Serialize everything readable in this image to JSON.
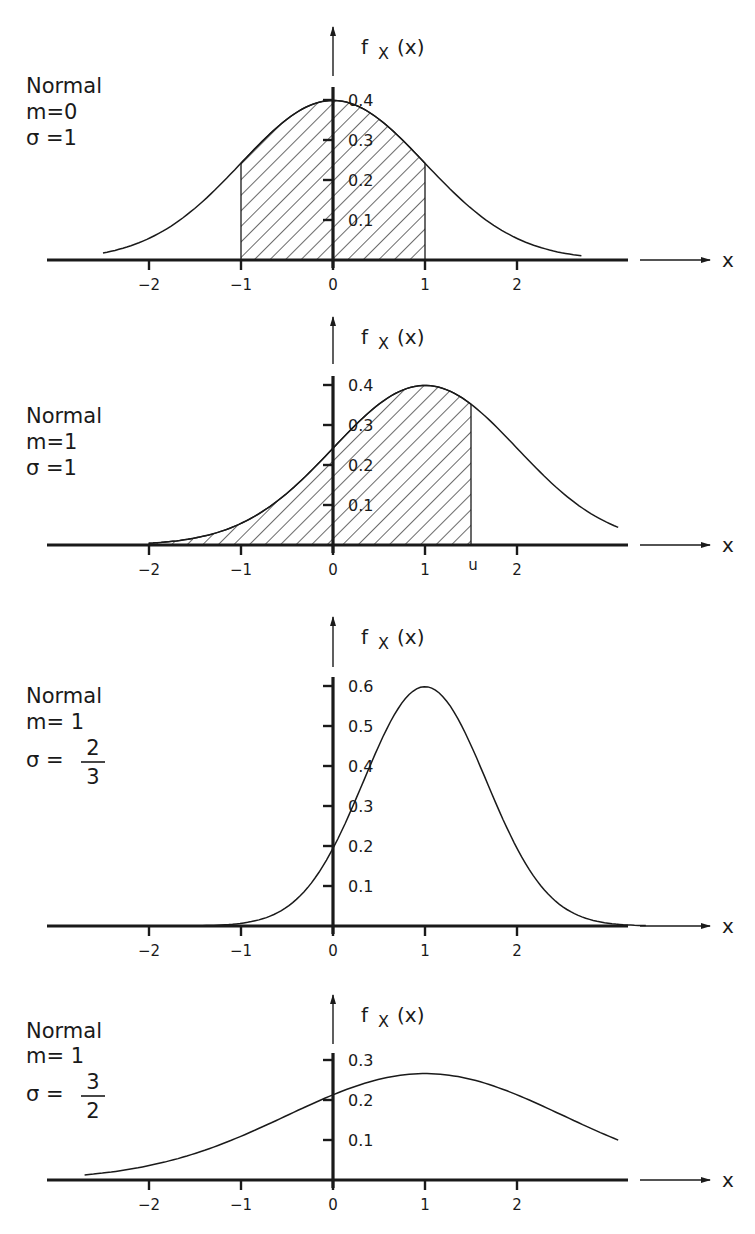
{
  "figure": {
    "axis_title_y": "f",
    "axis_title_y_sub": "X",
    "axis_title_y_arg": "(x)",
    "axis_title_x": "x",
    "colors": {
      "ink": "#1a1a1a",
      "background": "#ffffff"
    }
  },
  "panels": [
    {
      "name": "Normal",
      "m_label": "m=0",
      "sigma_label": "σ =1",
      "sigma_num": "",
      "sigma_den": "",
      "y_ticks": [
        "0.1",
        "0.2",
        "0.3",
        "0.4"
      ],
      "x_ticks": [
        "−2",
        "−1",
        "0",
        "1",
        "2"
      ],
      "shade_label": ""
    },
    {
      "name": "Normal",
      "m_label": "m=1",
      "sigma_label": "σ =1",
      "sigma_num": "",
      "sigma_den": "",
      "y_ticks": [
        "0.1",
        "0.2",
        "0.3",
        "0.4"
      ],
      "x_ticks": [
        "−2",
        "−1",
        "0",
        "1",
        "2"
      ],
      "shade_label": "u"
    },
    {
      "name": "Normal",
      "m_label": "m= 1",
      "sigma_label": "σ =",
      "sigma_num": "2",
      "sigma_den": "3",
      "y_ticks": [
        "0.1",
        "0.2",
        "0.3",
        "0.4",
        "0.5",
        "0.6"
      ],
      "x_ticks": [
        "−2",
        "−1",
        "0",
        "1",
        "2"
      ],
      "shade_label": ""
    },
    {
      "name": "Normal",
      "m_label": "m= 1",
      "sigma_label": "σ =",
      "sigma_num": "3",
      "sigma_den": "2",
      "y_ticks": [
        "0.1",
        "0.2",
        "0.3"
      ],
      "x_ticks": [
        "−2",
        "−1",
        "0",
        "1",
        "2"
      ],
      "shade_label": ""
    }
  ],
  "chart_data": [
    {
      "type": "line",
      "title": "Normal m=0 σ=1",
      "xlabel": "x",
      "ylabel": "f_X(x)",
      "mean": 0,
      "sigma": 1,
      "curve_x_range": [
        -2.5,
        2.7
      ],
      "shaded_interval": [
        -1,
        1
      ],
      "x_ticks": [
        -2,
        -1,
        0,
        1,
        2
      ],
      "y_ticks": [
        0.1,
        0.2,
        0.3,
        0.4
      ],
      "ylim": [
        0,
        0.43
      ],
      "x": [
        -2.5,
        -2,
        -1.5,
        -1,
        -0.5,
        0,
        0.5,
        1,
        1.5,
        2,
        2.5
      ],
      "values": [
        0.018,
        0.054,
        0.13,
        0.242,
        0.352,
        0.399,
        0.352,
        0.242,
        0.13,
        0.054,
        0.018
      ],
      "grid": false
    },
    {
      "type": "line",
      "title": "Normal m=1 σ=1",
      "xlabel": "x",
      "ylabel": "f_X(x)",
      "mean": 1,
      "sigma": 1,
      "curve_x_range": [
        -2,
        3.1
      ],
      "shaded_interval": [
        -2,
        1.5
      ],
      "shade_label": "u",
      "x_ticks": [
        -2,
        -1,
        0,
        1,
        2
      ],
      "y_ticks": [
        0.1,
        0.2,
        0.3,
        0.4
      ],
      "ylim": [
        0,
        0.43
      ],
      "x": [
        -2,
        -1.5,
        -1,
        -0.5,
        0,
        0.5,
        1,
        1.5,
        2,
        2.5,
        3
      ],
      "values": [
        0.004,
        0.018,
        0.054,
        0.13,
        0.242,
        0.352,
        0.399,
        0.352,
        0.242,
        0.13,
        0.054
      ],
      "grid": false
    },
    {
      "type": "line",
      "title": "Normal m=1 σ=2/3",
      "xlabel": "x",
      "ylabel": "f_X(x)",
      "mean": 1,
      "sigma": 0.6667,
      "curve_x_range": [
        -1.5,
        3.4
      ],
      "shaded_interval": null,
      "x_ticks": [
        -2,
        -1,
        0,
        1,
        2
      ],
      "y_ticks": [
        0.1,
        0.2,
        0.3,
        0.4,
        0.5,
        0.6
      ],
      "ylim": [
        0,
        0.63
      ],
      "x": [
        -1.5,
        -1,
        -0.5,
        0,
        0.5,
        1,
        1.5,
        2,
        2.5,
        3
      ],
      "values": [
        0.0005,
        0.007,
        0.048,
        0.194,
        0.451,
        0.598,
        0.451,
        0.194,
        0.048,
        0.007
      ],
      "grid": false
    },
    {
      "type": "line",
      "title": "Normal m=1 σ=3/2",
      "xlabel": "x",
      "ylabel": "f_X(x)",
      "mean": 1,
      "sigma": 1.5,
      "curve_x_range": [
        -2.7,
        3.1
      ],
      "shaded_interval": null,
      "x_ticks": [
        -2,
        -1,
        0,
        1,
        2
      ],
      "y_ticks": [
        0.1,
        0.2,
        0.3
      ],
      "ylim": [
        0,
        0.32
      ],
      "x": [
        -2.5,
        -2,
        -1.5,
        -1,
        -0.5,
        0,
        0.5,
        1,
        1.5,
        2,
        2.5,
        3
      ],
      "values": [
        0.017,
        0.036,
        0.067,
        0.109,
        0.161,
        0.213,
        0.252,
        0.266,
        0.252,
        0.213,
        0.161,
        0.109
      ],
      "grid": false
    }
  ]
}
